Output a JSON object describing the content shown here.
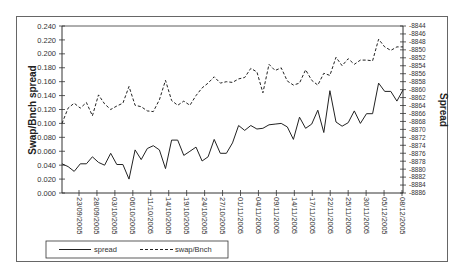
{
  "chart_data": {
    "type": "line",
    "title": "",
    "xlabel": "",
    "ylabel": "Swap/Bnch spread",
    "y2label": "Spread",
    "ylim": [
      0.0,
      0.24
    ],
    "y2lim": [
      -8886,
      -8844
    ],
    "yticks": [
      "0.240",
      "0.220",
      "0.200",
      "0.180",
      "0.160",
      "0.140",
      "0.120",
      "0.100",
      "0.080",
      "0.060",
      "0.040",
      "0.020",
      "0.000"
    ],
    "y2ticks": [
      "-8844",
      "-8846",
      "-8848",
      "-8850",
      "-8852",
      "-8854",
      "-8856",
      "-8858",
      "-8860",
      "-8862",
      "-8864",
      "-8866",
      "-8868",
      "-8870",
      "-8872",
      "-8874",
      "-8876",
      "-8878",
      "-8880",
      "-8882",
      "-8884",
      "-8886"
    ],
    "xtick_labels": [
      "23/09/2005",
      "28/09/2005",
      "03/10/2005",
      "06/10/2005",
      "11/10/2005",
      "14/10/2005",
      "19/10/2005",
      "24/10/2005",
      "27/10/2005",
      "01/11/2005",
      "04/11/2005",
      "09/11/2005",
      "14/11/2005",
      "17/11/2005",
      "22/11/2005",
      "25/11/2005",
      "30/11/2005",
      "05/12/2005",
      "08/12/2005"
    ],
    "legend_position": "bottom-left",
    "grid": false,
    "series": [
      {
        "name": "spread",
        "style": "solid",
        "axis": "left",
        "values": [
          0.042,
          0.038,
          0.031,
          0.042,
          0.042,
          0.052,
          0.044,
          0.04,
          0.057,
          0.041,
          0.041,
          0.02,
          0.062,
          0.048,
          0.064,
          0.068,
          0.062,
          0.035,
          0.076,
          0.076,
          0.054,
          0.06,
          0.066,
          0.046,
          0.052,
          0.077,
          0.057,
          0.057,
          0.072,
          0.097,
          0.09,
          0.097,
          0.092,
          0.093,
          0.098,
          0.099,
          0.1,
          0.095,
          0.077,
          0.109,
          0.093,
          0.099,
          0.119,
          0.087,
          0.147,
          0.102,
          0.096,
          0.101,
          0.118,
          0.1,
          0.114,
          0.114,
          0.158,
          0.146,
          0.146,
          0.132,
          0.148
        ]
      },
      {
        "name": "swap/Bnch",
        "style": "dashed",
        "axis": "left",
        "values": [
          0.1,
          0.122,
          0.129,
          0.122,
          0.13,
          0.111,
          0.141,
          0.128,
          0.12,
          0.125,
          0.129,
          0.153,
          0.126,
          0.124,
          0.118,
          0.117,
          0.134,
          0.162,
          0.133,
          0.126,
          0.132,
          0.126,
          0.14,
          0.151,
          0.158,
          0.167,
          0.158,
          0.16,
          0.159,
          0.164,
          0.166,
          0.179,
          0.174,
          0.144,
          0.185,
          0.176,
          0.18,
          0.161,
          0.155,
          0.158,
          0.177,
          0.162,
          0.155,
          0.172,
          0.169,
          0.195,
          0.183,
          0.193,
          0.185,
          0.191,
          0.191,
          0.19,
          0.221,
          0.21,
          0.205,
          0.21,
          0.21
        ]
      }
    ]
  },
  "legend": {
    "items": [
      {
        "label": "spread",
        "style": "solid"
      },
      {
        "label": "swap/Bnch",
        "style": "dashed"
      }
    ]
  },
  "colors": {
    "line": "#222222",
    "axis": "#333333",
    "frame": "#666666"
  }
}
